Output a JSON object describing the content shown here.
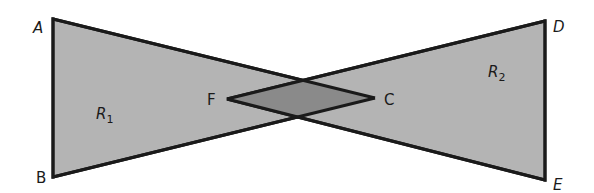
{
  "diagram": {
    "type": "bowtie-regions",
    "colors": {
      "background": "#ffffff",
      "region_fill": "#b4b4b4",
      "overlap_fill": "#8a8a8a",
      "stroke": "#1a1a1a"
    },
    "points": {
      "A": {
        "label": "A",
        "x": 53,
        "y": 19
      },
      "B": {
        "label": "B",
        "x": 53,
        "y": 177
      },
      "D": {
        "label": "D",
        "x": 545,
        "y": 21
      },
      "E": {
        "label": "E",
        "x": 545,
        "y": 180
      },
      "F": {
        "label": "F",
        "x": 227,
        "y": 99
      },
      "C": {
        "label": "C",
        "x": 375,
        "y": 98
      }
    },
    "regions": {
      "R1": {
        "base": "R",
        "subscript": "1"
      },
      "R2": {
        "base": "R",
        "subscript": "2"
      }
    },
    "shapes": [
      {
        "name": "triangle-ABC",
        "vertices": [
          "A",
          "B",
          "C"
        ],
        "fill": "region_fill"
      },
      {
        "name": "triangle-DEF",
        "vertices": [
          "D",
          "E",
          "F"
        ],
        "fill": "region_fill"
      },
      {
        "name": "overlap-rhombus",
        "vertices": [
          "F",
          "top-intersection",
          "C",
          "bottom-intersection"
        ],
        "fill": "overlap_fill"
      }
    ]
  }
}
